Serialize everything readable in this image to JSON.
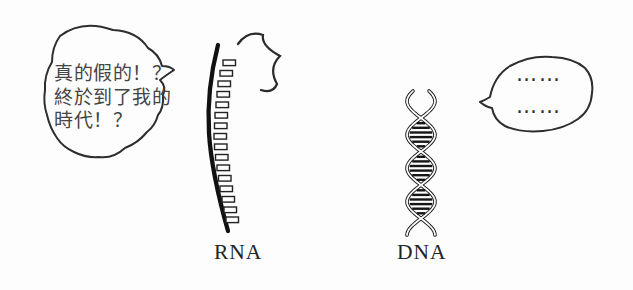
{
  "panel": {
    "background_color": "#fdfdfd",
    "ink_color": "#2a2a2a"
  },
  "rna": {
    "label": "RNA",
    "speech_bubble": {
      "lines": [
        "真的假的！？",
        "終於到了我的",
        "時代！？"
      ]
    },
    "icons": {
      "burst": "excitement-burst"
    }
  },
  "dna": {
    "label": "DNA",
    "speech_bubble": {
      "lines": [
        "……",
        "……"
      ]
    }
  }
}
